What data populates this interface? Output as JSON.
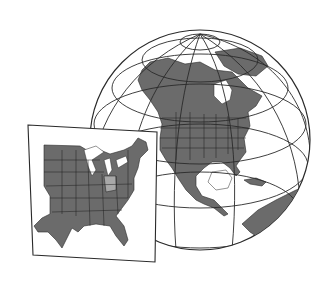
{
  "illustration": {
    "subject": "Globe centered on North America with inset map of eastern United States",
    "highlighted_region": "Ohio",
    "colors": {
      "background": "#ffffff",
      "land": "#6b6b6b",
      "highlight": "#a8a8a8",
      "outline": "#2a2a2a",
      "water": "#ffffff"
    },
    "globe": {
      "cx": 200,
      "cy": 140,
      "r": 110
    },
    "inset": {
      "corners": [
        [
          28,
          125
        ],
        [
          157,
          132
        ],
        [
          155,
          262
        ],
        [
          33,
          255
        ]
      ]
    }
  }
}
